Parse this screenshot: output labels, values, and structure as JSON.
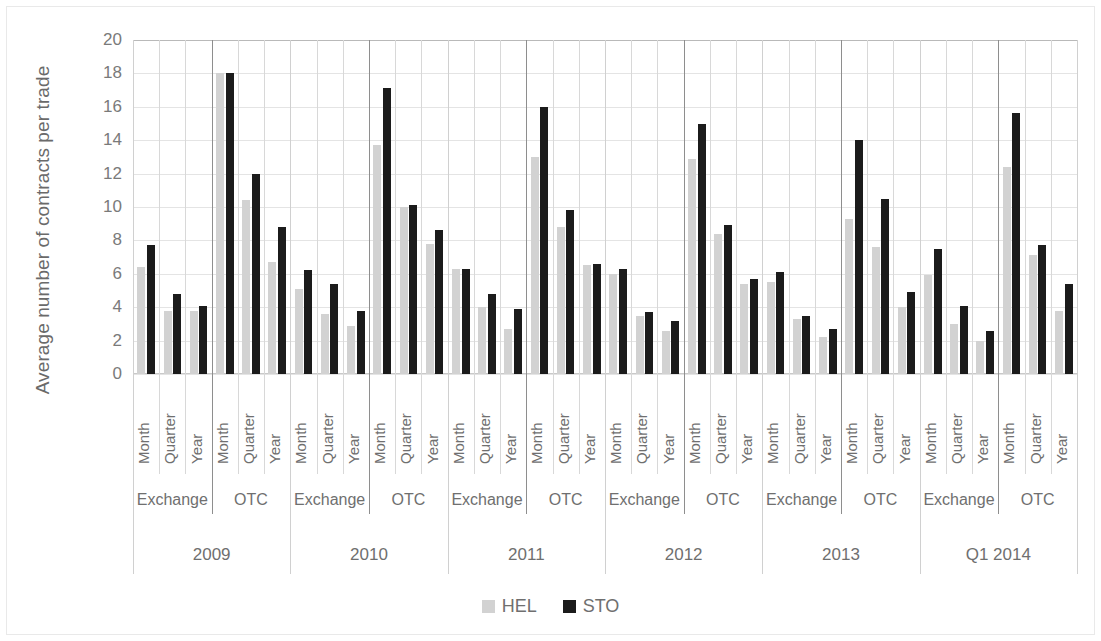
{
  "chart_data": {
    "type": "bar",
    "title": "",
    "xlabel": "",
    "ylabel": "Average number of contracts per trade",
    "ylim": [
      0,
      20
    ],
    "ytick_step": 2,
    "yticks": [
      "20",
      "18",
      "16",
      "14",
      "12",
      "10",
      "8",
      "6",
      "4",
      "2",
      "0"
    ],
    "grid": true,
    "legend_position": "bottom",
    "colors": {
      "HEL": "#d2d2d2",
      "STO": "#1b1b1b"
    },
    "legend": [
      {
        "name": "HEL",
        "color": "#d2d2d2"
      },
      {
        "name": "STO",
        "color": "#1b1b1b"
      }
    ],
    "series_names": [
      "HEL",
      "STO"
    ],
    "period_labels": [
      "Month",
      "Quarter",
      "Year"
    ],
    "venue_labels": [
      "Exchange",
      "OTC"
    ],
    "year_labels": [
      "2009",
      "2010",
      "2011",
      "2012",
      "2013",
      "Q1 2014"
    ],
    "groups": [
      {
        "year": "2009",
        "venues": [
          {
            "venue": "Exchange",
            "periods": [
              {
                "period": "Month",
                "HEL": 6.4,
                "STO": 7.7
              },
              {
                "period": "Quarter",
                "HEL": 3.8,
                "STO": 4.8
              },
              {
                "period": "Year",
                "HEL": 3.8,
                "STO": 4.1
              }
            ]
          },
          {
            "venue": "OTC",
            "periods": [
              {
                "period": "Month",
                "HEL": 18.0,
                "STO": 18.0
              },
              {
                "period": "Quarter",
                "HEL": 10.4,
                "STO": 12.0
              },
              {
                "period": "Year",
                "HEL": 6.7,
                "STO": 8.8
              }
            ]
          }
        ]
      },
      {
        "year": "2010",
        "venues": [
          {
            "venue": "Exchange",
            "periods": [
              {
                "period": "Month",
                "HEL": 5.1,
                "STO": 6.2
              },
              {
                "period": "Quarter",
                "HEL": 3.6,
                "STO": 5.4
              },
              {
                "period": "Year",
                "HEL": 2.9,
                "STO": 3.8
              }
            ]
          },
          {
            "venue": "OTC",
            "periods": [
              {
                "period": "Month",
                "HEL": 13.7,
                "STO": 17.1
              },
              {
                "period": "Quarter",
                "HEL": 10.0,
                "STO": 10.1
              },
              {
                "period": "Year",
                "HEL": 7.8,
                "STO": 8.6
              }
            ]
          }
        ]
      },
      {
        "year": "2011",
        "venues": [
          {
            "venue": "Exchange",
            "periods": [
              {
                "period": "Month",
                "HEL": 6.3,
                "STO": 6.3
              },
              {
                "period": "Quarter",
                "HEL": 4.0,
                "STO": 4.8
              },
              {
                "period": "Year",
                "HEL": 2.7,
                "STO": 3.9
              }
            ]
          },
          {
            "venue": "OTC",
            "periods": [
              {
                "period": "Month",
                "HEL": 13.0,
                "STO": 16.0
              },
              {
                "period": "Quarter",
                "HEL": 8.8,
                "STO": 9.8
              },
              {
                "period": "Year",
                "HEL": 6.5,
                "STO": 6.6
              }
            ]
          }
        ]
      },
      {
        "year": "2012",
        "venues": [
          {
            "venue": "Exchange",
            "periods": [
              {
                "period": "Month",
                "HEL": 6.0,
                "STO": 6.3
              },
              {
                "period": "Quarter",
                "HEL": 3.5,
                "STO": 3.7
              },
              {
                "period": "Year",
                "HEL": 2.6,
                "STO": 3.2
              }
            ]
          },
          {
            "venue": "OTC",
            "periods": [
              {
                "period": "Month",
                "HEL": 12.9,
                "STO": 15.0
              },
              {
                "period": "Quarter",
                "HEL": 8.4,
                "STO": 8.9
              },
              {
                "period": "Year",
                "HEL": 5.4,
                "STO": 5.7
              }
            ]
          }
        ]
      },
      {
        "year": "2013",
        "venues": [
          {
            "venue": "Exchange",
            "periods": [
              {
                "period": "Month",
                "HEL": 5.5,
                "STO": 6.1
              },
              {
                "period": "Quarter",
                "HEL": 3.3,
                "STO": 3.5
              },
              {
                "period": "Year",
                "HEL": 2.2,
                "STO": 2.7
              }
            ]
          },
          {
            "venue": "OTC",
            "periods": [
              {
                "period": "Month",
                "HEL": 9.3,
                "STO": 14.0
              },
              {
                "period": "Quarter",
                "HEL": 7.6,
                "STO": 10.5
              },
              {
                "period": "Year",
                "HEL": 4.0,
                "STO": 4.9
              }
            ]
          }
        ]
      },
      {
        "year": "Q1 2014",
        "venues": [
          {
            "venue": "Exchange",
            "periods": [
              {
                "period": "Month",
                "HEL": 5.9,
                "STO": 7.5
              },
              {
                "period": "Quarter",
                "HEL": 3.0,
                "STO": 4.1
              },
              {
                "period": "Year",
                "HEL": 2.0,
                "STO": 2.6
              }
            ]
          },
          {
            "venue": "OTC",
            "periods": [
              {
                "period": "Month",
                "HEL": 12.4,
                "STO": 15.6
              },
              {
                "period": "Quarter",
                "HEL": 7.1,
                "STO": 7.7
              },
              {
                "period": "Year",
                "HEL": 3.8,
                "STO": 5.4
              }
            ]
          }
        ]
      }
    ]
  }
}
